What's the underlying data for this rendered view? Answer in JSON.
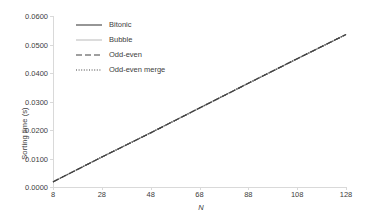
{
  "chart_data": {
    "type": "line",
    "title": "",
    "xlabel": "N",
    "ylabel": "Sorting time (s)",
    "xlim": [
      8,
      128
    ],
    "ylim": [
      0.0,
      0.06
    ],
    "grid": false,
    "legend_position": "top-left-inside",
    "x_ticks": [
      "8",
      "28",
      "48",
      "68",
      "88",
      "108",
      "128"
    ],
    "x_tick_values": [
      8,
      28,
      48,
      68,
      88,
      108,
      128
    ],
    "y_ticks": [
      "0.0000",
      "0.0100",
      "0.0200",
      "0.0300",
      "0.0400",
      "0.0500",
      "0.0600"
    ],
    "y_tick_values": [
      0.0,
      0.01,
      0.02,
      0.03,
      0.04,
      0.05,
      0.06
    ],
    "x": [
      8,
      28,
      48,
      68,
      88,
      108,
      128
    ],
    "series": [
      {
        "name": "Bitonic",
        "style": "solid",
        "color": "#404040",
        "values": [
          0.0018,
          0.0105,
          0.019,
          0.0277,
          0.0364,
          0.045,
          0.0535
        ]
      },
      {
        "name": "Bubble",
        "style": "solid-light",
        "color": "#bfbfbf",
        "values": [
          0.0018,
          0.0105,
          0.019,
          0.0277,
          0.0364,
          0.045,
          0.0535
        ]
      },
      {
        "name": "Odd-even",
        "style": "dashed",
        "color": "#404040",
        "values": [
          0.0018,
          0.0105,
          0.019,
          0.0277,
          0.0364,
          0.045,
          0.0535
        ]
      },
      {
        "name": "Odd-even merge",
        "style": "dotted",
        "color": "#404040",
        "values": [
          0.0018,
          0.0105,
          0.019,
          0.0277,
          0.0364,
          0.045,
          0.0535
        ]
      }
    ]
  },
  "legend": {
    "items": [
      {
        "label": "Bitonic"
      },
      {
        "label": "Bubble"
      },
      {
        "label": "Odd-even"
      },
      {
        "label": "Odd-even merge"
      }
    ]
  },
  "axes": {
    "y_title": "Sorting time (s)",
    "x_title": "N"
  }
}
